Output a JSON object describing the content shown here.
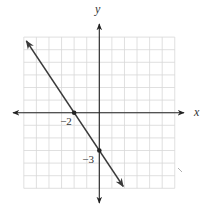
{
  "chart_data": {
    "type": "line",
    "title": "",
    "xlabel": "x",
    "ylabel": "y",
    "xlim": [
      -6,
      6
    ],
    "ylim": [
      -6,
      6
    ],
    "grid": true,
    "series": [
      {
        "name": "y = -3/2 x - 3",
        "x": [
          -5.8,
          1.9
        ],
        "y": [
          5.7,
          -5.85
        ],
        "slope": -1.5,
        "intercept": -3,
        "arrows": "both"
      }
    ],
    "points": [
      {
        "x": -2,
        "y": 0,
        "label": "−2"
      },
      {
        "x": 0,
        "y": -3,
        "label": "−3"
      }
    ],
    "annotations": [
      "−2",
      "−3"
    ],
    "colors": {
      "line": "#3a3a3a",
      "grid": "#d8d8d8",
      "axis": "#222222"
    }
  }
}
